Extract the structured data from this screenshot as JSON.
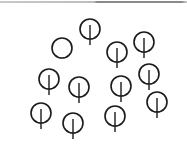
{
  "diagram": {
    "stroke_color": "#1a1a1a",
    "background": "#ffffff",
    "top_rule_color": "#8a8a8a",
    "radius": 10,
    "nodes": [
      {
        "id": "n1",
        "cx": 62,
        "cy": 48,
        "stem": false
      },
      {
        "id": "n2",
        "cx": 90,
        "cy": 29,
        "stem": true
      },
      {
        "id": "n3",
        "cx": 117,
        "cy": 52,
        "stem": true
      },
      {
        "id": "n4",
        "cx": 144,
        "cy": 42,
        "stem": true
      },
      {
        "id": "n5",
        "cx": 49,
        "cy": 79,
        "stem": true
      },
      {
        "id": "n6",
        "cx": 79,
        "cy": 87,
        "stem": true
      },
      {
        "id": "n7",
        "cx": 121,
        "cy": 86,
        "stem": true
      },
      {
        "id": "n8",
        "cx": 149,
        "cy": 74,
        "stem": true
      },
      {
        "id": "n9",
        "cx": 41,
        "cy": 113,
        "stem": true
      },
      {
        "id": "n10",
        "cx": 73,
        "cy": 123,
        "stem": true
      },
      {
        "id": "n11",
        "cx": 115,
        "cy": 116,
        "stem": true
      },
      {
        "id": "n12",
        "cx": 157,
        "cy": 102,
        "stem": true
      }
    ]
  }
}
